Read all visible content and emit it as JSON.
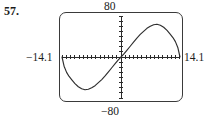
{
  "exercise": {
    "number_label": "57."
  },
  "calculator": {
    "screen_name": "graphing-calculator-screen",
    "window": {
      "ymax_label": "80",
      "ymin_label": "−80",
      "xmin_label": "−14.1",
      "xmax_label": "14.1"
    },
    "colors": {
      "bezel": "#3a3a3a",
      "axis": "#2b2b2b",
      "curve": "#2e2e2e",
      "screen_background": "#ffffff"
    }
  },
  "chart_data": {
    "type": "line",
    "title": "",
    "xlabel": "",
    "ylabel": "",
    "xlim": [
      -14.1,
      14.1
    ],
    "ylim": [
      -80,
      80
    ],
    "grid": false,
    "legend": "none",
    "axis_ticks": {
      "x_tick_spacing": 1,
      "y_tick_spacing": 10,
      "x_tick_count": 28,
      "y_tick_count": 16
    },
    "annotations": [
      "Ymax = 80 shown above screen",
      "Ymin = -80 shown below screen",
      "Xmin = -14.1 shown left of screen",
      "Xmax = 14.1 shown right of screen"
    ],
    "series": [
      {
        "name": "curve",
        "description": "odd S-shaped curve: falls steeply from 0 at the left edge to a minimum near x=-8.5 (y=-62), rises through the origin, reaches a maximum near x=7.5 (y=72), then falls steeply to 0 at the right edge",
        "x": [
          -14.1,
          -13.6,
          -13.0,
          -12.4,
          -11.7,
          -11.0,
          -10.2,
          -9.4,
          -8.6,
          -7.8,
          -7.0,
          -6.2,
          -5.4,
          -4.6,
          -3.8,
          -3.0,
          -2.2,
          -1.4,
          -0.7,
          0.0,
          0.7,
          1.4,
          2.2,
          3.0,
          3.8,
          4.6,
          5.4,
          6.2,
          7.0,
          7.8,
          8.6,
          9.4,
          10.2,
          11.0,
          11.7,
          12.4,
          13.0,
          13.6,
          14.1
        ],
        "y": [
          0,
          -18,
          -30,
          -38,
          -45,
          -52,
          -58,
          -62,
          -64,
          -63,
          -60,
          -56,
          -50,
          -44,
          -37,
          -29,
          -21,
          -13,
          -6,
          0,
          6,
          13,
          21,
          29,
          37,
          44,
          50,
          56,
          60,
          63,
          64,
          62,
          58,
          52,
          45,
          38,
          30,
          18,
          0
        ]
      }
    ]
  }
}
